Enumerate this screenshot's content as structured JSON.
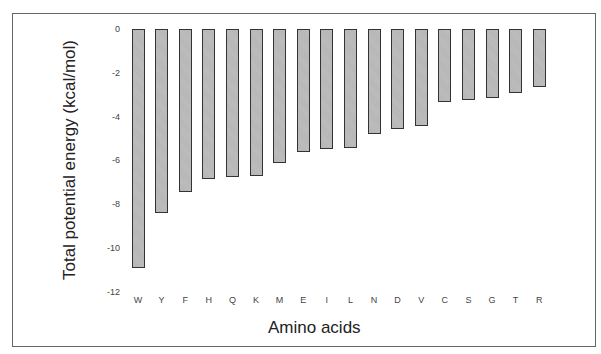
{
  "chart_data": {
    "type": "bar",
    "title": "",
    "xlabel": "Amino acids",
    "ylabel": "Total potential energy (kcal/mol)",
    "ylim": [
      -12,
      0
    ],
    "yticks": [
      "0",
      "-2",
      "-4",
      "-6",
      "-8",
      "-10",
      "-12"
    ],
    "grid": false,
    "legend": null,
    "categories": [
      "W",
      "Y",
      "F",
      "H",
      "Q",
      "K",
      "M",
      "E",
      "I",
      "L",
      "N",
      "D",
      "V",
      "C",
      "S",
      "G",
      "T",
      "R"
    ],
    "values": [
      -10.9,
      -8.4,
      -7.45,
      -6.85,
      -6.75,
      -6.7,
      -6.1,
      -5.6,
      -5.5,
      -5.45,
      -4.8,
      -4.55,
      -4.45,
      -3.35,
      -3.25,
      -3.15,
      -2.9,
      -2.65
    ]
  },
  "colors": {
    "bar_fill": "#bdbdbd",
    "bar_border": "#333333",
    "frame": "#666666"
  }
}
